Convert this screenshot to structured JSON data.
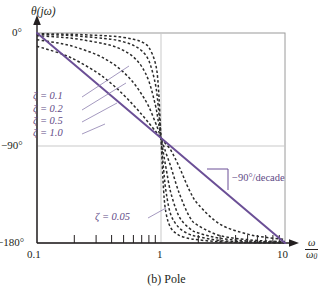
{
  "figure": {
    "caption": "(b) Pole",
    "background": "#ffffff"
  },
  "axes": {
    "y_axis_title": "θ(jω)",
    "x_axis_title_num": "ω",
    "x_axis_title_den": "ω",
    "x_axis_title_den_sub": "0",
    "y_ticks": [
      "0°",
      "−90°",
      "−180°"
    ],
    "x_ticks": [
      "0.1",
      "1",
      "10"
    ]
  },
  "annotations": {
    "slope": "−90°/decade",
    "zeta_01": "ζ = 0.1",
    "zeta_02": "ζ = 0.2",
    "zeta_05": "ζ = 0.5",
    "zeta_10": "ζ = 1.0",
    "zeta_005": "ζ = 0.05"
  },
  "colors": {
    "accent_purple": "#6b4f96",
    "curve_dashed": "#2b2b2b",
    "grid": "#c9c9c9",
    "frame": "#9a9a9a",
    "text": "#231f20",
    "leader": "#8d7fae"
  },
  "chart_data": {
    "type": "line",
    "title": "(b) Pole",
    "xlabel": "ω/ω₀",
    "ylabel": "θ(jω)",
    "xscale": "log",
    "xlim": [
      0.1,
      10
    ],
    "ylim": [
      -180,
      0
    ],
    "yticks": [
      0,
      -90,
      -180
    ],
    "ytick_labels": [
      "0°",
      "−90°",
      "−180°"
    ],
    "xticks": [
      0.1,
      1,
      10
    ],
    "xtick_labels": [
      "0.1",
      "1",
      "10"
    ],
    "xminor_ticks": [
      0.2,
      0.3,
      0.4,
      0.5,
      0.6,
      0.7,
      0.8,
      0.9,
      2,
      3,
      4,
      5,
      6,
      7,
      8,
      9
    ],
    "grid": "gridline at x=1 and y=-90 only",
    "legend": "inline labels",
    "units": "degrees",
    "note": "Phase of second-order pole 1/(1 + 2ζ(jω/ω₀) + (jω/ω₀)^2); theta = -atan2(2ζ u, 1-u^2), u = ω/ω₀",
    "series": [
      {
        "name": "ζ = 0.05",
        "zeta": 0.05,
        "style": "dashed",
        "color": "#2b2b2b",
        "x": [
          0.1,
          0.15,
          0.2,
          0.3,
          0.4,
          0.5,
          0.6,
          0.7,
          0.8,
          0.9,
          0.95,
          1.0,
          1.05,
          1.1,
          1.2,
          1.4,
          1.7,
          2.0,
          3.0,
          5.0,
          7.0,
          10.0
        ],
        "y": [
          -0.6,
          -0.9,
          -1.2,
          -2.0,
          -2.7,
          -3.8,
          -5.4,
          -7.7,
          -12.5,
          -25.8,
          -44.6,
          -90.0,
          -135.2,
          -154.6,
          -167.1,
          -173.4,
          -176.2,
          -177.3,
          -179.0,
          -179.6,
          -179.8,
          -179.9
        ]
      },
      {
        "name": "ζ = 0.1",
        "zeta": 0.1,
        "style": "dashed",
        "color": "#2b2b2b",
        "x": [
          0.1,
          0.15,
          0.2,
          0.3,
          0.4,
          0.5,
          0.6,
          0.7,
          0.8,
          0.9,
          0.95,
          1.0,
          1.05,
          1.1,
          1.2,
          1.4,
          1.7,
          2.0,
          3.0,
          5.0,
          7.0,
          10.0
        ],
        "y": [
          -1.2,
          -1.7,
          -2.4,
          -4.0,
          -5.4,
          -7.6,
          -10.6,
          -15.3,
          -24.0,
          -43.5,
          -62.8,
          -90.0,
          -117.1,
          -136.4,
          -155.7,
          -167.0,
          -172.6,
          -174.6,
          -177.9,
          -179.2,
          -179.6,
          -179.8
        ]
      },
      {
        "name": "ζ = 0.2",
        "zeta": 0.2,
        "style": "dashed",
        "color": "#2b2b2b",
        "x": [
          0.1,
          0.15,
          0.2,
          0.3,
          0.4,
          0.5,
          0.6,
          0.7,
          0.8,
          0.9,
          0.95,
          1.0,
          1.05,
          1.1,
          1.2,
          1.4,
          1.7,
          2.0,
          3.0,
          5.0,
          7.0,
          10.0
        ],
        "y": [
          -2.3,
          -3.5,
          -4.8,
          -7.9,
          -10.8,
          -15.0,
          -20.6,
          -28.9,
          -41.6,
          -61.6,
          -75.4,
          -90.0,
          -104.0,
          -116.2,
          -137.0,
          -157.3,
          -167.5,
          -171.4,
          -176.0,
          -178.3,
          -179.0,
          -179.5
        ]
      },
      {
        "name": "ζ = 0.5",
        "zeta": 0.5,
        "style": "dashed",
        "color": "#2b2b2b",
        "x": [
          0.1,
          0.15,
          0.2,
          0.3,
          0.4,
          0.5,
          0.6,
          0.7,
          0.8,
          0.9,
          0.95,
          1.0,
          1.05,
          1.1,
          1.2,
          1.4,
          1.7,
          2.0,
          3.0,
          5.0,
          7.0,
          10.0
        ],
        "y": [
          -5.8,
          -8.7,
          -11.8,
          -18.4,
          -25.6,
          -33.7,
          -42.7,
          -52.7,
          -63.4,
          -76.6,
          -83.1,
          -90.0,
          -96.8,
          -103.2,
          -114.6,
          -137.0,
          -157.6,
          -165.1,
          -173.7,
          -177.1,
          -178.3,
          -178.8
        ]
      },
      {
        "name": "ζ = 1.0",
        "zeta": 1.0,
        "style": "dashed",
        "color": "#2b2b2b",
        "x": [
          0.1,
          0.15,
          0.2,
          0.3,
          0.4,
          0.5,
          0.6,
          0.7,
          0.8,
          0.9,
          0.95,
          1.0,
          1.05,
          1.1,
          1.2,
          1.4,
          1.7,
          2.0,
          3.0,
          5.0,
          7.0,
          10.0
        ],
        "y": [
          -11.4,
          -17.1,
          -22.6,
          -33.4,
          -43.6,
          -53.1,
          -61.9,
          -69.9,
          -77.3,
          -84.0,
          -87.1,
          -90.0,
          -92.8,
          -95.5,
          -100.4,
          -114.6,
          -135.1,
          -147.0,
          -164.0,
          -172.4,
          -175.1,
          -177.0
        ]
      },
      {
        "name": "asymptote",
        "style": "solid",
        "color": "#6b4f96",
        "x": [
          0.1,
          1.0,
          10.0
        ],
        "y": [
          0,
          -90,
          -180
        ]
      }
    ]
  }
}
